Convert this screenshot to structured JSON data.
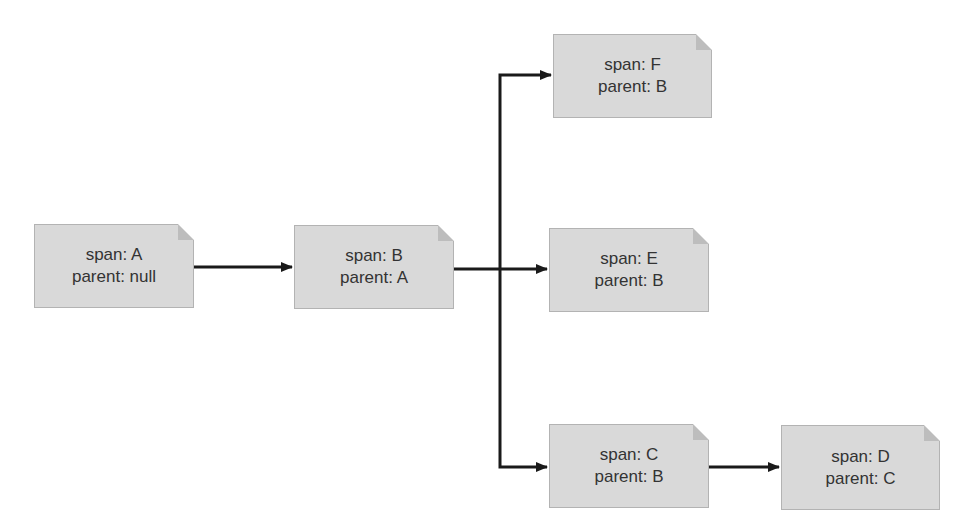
{
  "diagram": {
    "type": "span-tree",
    "nodes": [
      {
        "id": "A",
        "span_label": "span: A",
        "parent_label": "parent: null",
        "x": 34,
        "y": 224,
        "w": 160,
        "h": 84
      },
      {
        "id": "B",
        "span_label": "span: B",
        "parent_label": "parent: A",
        "x": 294,
        "y": 225,
        "w": 160,
        "h": 84
      },
      {
        "id": "F",
        "span_label": "span: F",
        "parent_label": "parent: B",
        "x": 553,
        "y": 34,
        "w": 159,
        "h": 84
      },
      {
        "id": "E",
        "span_label": "span: E",
        "parent_label": "parent: B",
        "x": 549,
        "y": 228,
        "w": 160,
        "h": 84
      },
      {
        "id": "C",
        "span_label": "span: C",
        "parent_label": "parent: B",
        "x": 549,
        "y": 424,
        "w": 160,
        "h": 84
      },
      {
        "id": "D",
        "span_label": "span: D",
        "parent_label": "parent: C",
        "x": 781,
        "y": 425,
        "w": 159,
        "h": 85
      }
    ],
    "edges": [
      {
        "from": "A",
        "to": "B"
      },
      {
        "from": "B",
        "to": "F"
      },
      {
        "from": "B",
        "to": "E"
      },
      {
        "from": "B",
        "to": "C"
      },
      {
        "from": "C",
        "to": "D"
      }
    ],
    "colors": {
      "node_fill": "#d9d9d9",
      "node_border": "#b3b3b3",
      "edge": "#1a1a1a",
      "text": "#333333"
    }
  }
}
